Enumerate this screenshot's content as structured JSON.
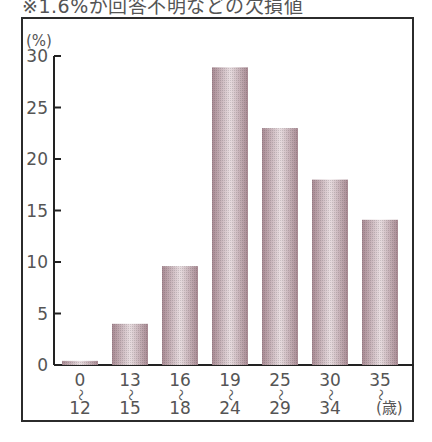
{
  "note": "※1.6%が回答不明などの欠損値",
  "chart_data": {
    "type": "bar",
    "title": "",
    "ylabel": "(%)",
    "xlabel": "(歳)",
    "ylim": [
      0,
      30
    ],
    "yticks": [
      0,
      5,
      10,
      15,
      20,
      25,
      30
    ],
    "grid": false,
    "categories": [
      {
        "from": "0",
        "to": "12"
      },
      {
        "from": "13",
        "to": "15"
      },
      {
        "from": "16",
        "to": "18"
      },
      {
        "from": "19",
        "to": "24"
      },
      {
        "from": "25",
        "to": "29"
      },
      {
        "from": "30",
        "to": "34"
      },
      {
        "from": "35",
        "to": ""
      }
    ],
    "range_symbol": "～",
    "values": [
      0.4,
      4.0,
      9.6,
      28.9,
      23.0,
      18.0,
      14.1
    ],
    "bar_color": "#a88a93",
    "bar_highlight": "#e8dde0"
  }
}
